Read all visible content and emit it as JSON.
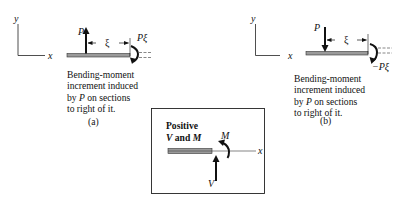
{
  "panel_a": {
    "axis_y_label": "y",
    "axis_x_label": "x",
    "force_label": "P",
    "distance_label": "ξ",
    "moment_label": "Pξ",
    "caption_lines": [
      "Bending-moment",
      "increment induced",
      "by ",
      "P",
      " on sections",
      "to right of it."
    ],
    "caption": {
      "line1": "Bending-moment",
      "line2": "increment induced",
      "line3_pre": "by ",
      "line3_var": "P",
      "line3_post": " on sections",
      "line4": "to right of it."
    },
    "sublabel": "(a)"
  },
  "panel_b": {
    "axis_y_label": "y",
    "axis_x_label": "x",
    "force_label": "P",
    "distance_label": "ξ",
    "moment_label": "−Pξ",
    "caption": {
      "line1": "Bending-moment",
      "line2": "increment induced",
      "line3_pre": "by ",
      "line3_var": "P",
      "line3_post": " on sections",
      "line4": "to right of it."
    },
    "sublabel": "(b)"
  },
  "legend_box": {
    "title_line1": "Positive",
    "title_line2_v": "V",
    "title_line2_and": " and ",
    "title_line2_m": "M",
    "moment_label": "M",
    "shear_label": "V",
    "axis_label": "x"
  },
  "colors": {
    "ink": "#111111",
    "beam_fill": "#9a9a9a",
    "background": "#ffffff"
  }
}
